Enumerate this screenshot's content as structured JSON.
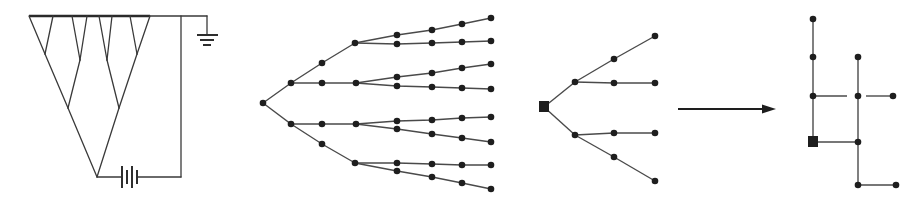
{
  "figure": {
    "panels": [
      {
        "id": "circuit",
        "description": "Branching conductor tree connected to a battery and ground",
        "top_bar": {
          "x1": 29,
          "x2": 150,
          "y": 16
        },
        "branches": [
          [
            29,
            16,
            45,
            54
          ],
          [
            53,
            16,
            45,
            54
          ],
          [
            45,
            54,
            68,
            108
          ],
          [
            72,
            16,
            80,
            60
          ],
          [
            87,
            16,
            80,
            60
          ],
          [
            80,
            60,
            68,
            108
          ],
          [
            68,
            108,
            97,
            177
          ],
          [
            99,
            16,
            107,
            60
          ],
          [
            112,
            16,
            107,
            60
          ],
          [
            107,
            60,
            119,
            108
          ],
          [
            130,
            16,
            137,
            54
          ],
          [
            150,
            16,
            137,
            54
          ],
          [
            137,
            54,
            119,
            108
          ],
          [
            119,
            108,
            97,
            177
          ]
        ],
        "wires": [
          [
            150,
            16,
            207,
            16
          ],
          [
            207,
            16,
            207,
            35
          ],
          [
            181,
            16,
            181,
            177
          ],
          [
            97,
            177,
            121,
            177
          ],
          [
            138,
            177,
            181,
            177
          ]
        ],
        "battery_plates": [
          {
            "x": 122,
            "y1": 166,
            "y2": 188
          },
          {
            "x": 127,
            "y1": 170,
            "y2": 184
          },
          {
            "x": 132,
            "y1": 166,
            "y2": 188
          },
          {
            "x": 137,
            "y1": 170,
            "y2": 184
          }
        ],
        "ground_lines": [
          {
            "x1": 197,
            "x2": 218,
            "y": 35
          },
          {
            "x1": 200,
            "x2": 214,
            "y": 40
          },
          {
            "x1": 203,
            "x2": 211,
            "y": 45
          }
        ]
      },
      {
        "id": "binary-tree",
        "description": "Dotted binary tree graph",
        "nodes": [
          [
            263,
            103
          ],
          [
            291,
            83
          ],
          [
            291,
            124
          ],
          [
            322,
            63
          ],
          [
            322,
            83
          ],
          [
            322,
            124
          ],
          [
            322,
            144
          ],
          [
            355,
            43
          ],
          [
            356,
            83
          ],
          [
            356,
            124
          ],
          [
            355,
            163
          ],
          [
            397,
            35
          ],
          [
            432,
            30
          ],
          [
            462,
            24
          ],
          [
            491,
            18
          ],
          [
            397,
            44
          ],
          [
            432,
            43
          ],
          [
            462,
            42
          ],
          [
            491,
            41
          ],
          [
            397,
            77
          ],
          [
            432,
            73
          ],
          [
            462,
            68
          ],
          [
            491,
            64
          ],
          [
            397,
            86
          ],
          [
            432,
            87
          ],
          [
            462,
            88
          ],
          [
            491,
            89
          ],
          [
            397,
            121
          ],
          [
            432,
            120
          ],
          [
            462,
            118
          ],
          [
            491,
            117
          ],
          [
            397,
            129
          ],
          [
            432,
            134
          ],
          [
            462,
            138
          ],
          [
            491,
            142
          ],
          [
            397,
            163
          ],
          [
            432,
            164
          ],
          [
            462,
            165
          ],
          [
            491,
            165
          ],
          [
            397,
            171
          ],
          [
            432,
            177
          ],
          [
            462,
            183
          ],
          [
            491,
            189
          ]
        ],
        "polylines": [
          [
            [
              263,
              103
            ],
            [
              291,
              83
            ],
            [
              322,
              63
            ],
            [
              355,
              43
            ]
          ],
          [
            [
              291,
              83
            ],
            [
              322,
              83
            ],
            [
              356,
              83
            ]
          ],
          [
            [
              263,
              103
            ],
            [
              291,
              124
            ],
            [
              322,
              124
            ],
            [
              356,
              124
            ]
          ],
          [
            [
              291,
              124
            ],
            [
              322,
              144
            ],
            [
              355,
              163
            ]
          ],
          [
            [
              355,
              43
            ],
            [
              397,
              35
            ],
            [
              432,
              30
            ],
            [
              462,
              24
            ],
            [
              491,
              18
            ]
          ],
          [
            [
              355,
              43
            ],
            [
              397,
              44
            ],
            [
              432,
              43
            ],
            [
              462,
              42
            ],
            [
              491,
              41
            ]
          ],
          [
            [
              356,
              83
            ],
            [
              397,
              77
            ],
            [
              432,
              73
            ],
            [
              462,
              68
            ],
            [
              491,
              64
            ]
          ],
          [
            [
              356,
              83
            ],
            [
              397,
              86
            ],
            [
              432,
              87
            ],
            [
              462,
              88
            ],
            [
              491,
              89
            ]
          ],
          [
            [
              356,
              124
            ],
            [
              397,
              121
            ],
            [
              432,
              120
            ],
            [
              462,
              118
            ],
            [
              491,
              117
            ]
          ],
          [
            [
              356,
              124
            ],
            [
              397,
              129
            ],
            [
              432,
              134
            ],
            [
              462,
              138
            ],
            [
              491,
              142
            ]
          ],
          [
            [
              355,
              163
            ],
            [
              397,
              163
            ],
            [
              432,
              164
            ],
            [
              462,
              165
            ],
            [
              491,
              165
            ]
          ],
          [
            [
              355,
              163
            ],
            [
              397,
              171
            ],
            [
              432,
              177
            ],
            [
              462,
              183
            ],
            [
              491,
              189
            ]
          ]
        ]
      },
      {
        "id": "rooted-tree",
        "description": "Small tree rooted at a square node",
        "root": [
          544,
          107
        ],
        "nodes": [
          [
            575,
            82
          ],
          [
            575,
            135
          ],
          [
            614,
            59
          ],
          [
            614,
            83
          ],
          [
            614,
            133
          ],
          [
            614,
            157
          ],
          [
            655,
            36
          ],
          [
            655,
            83
          ],
          [
            655,
            133
          ],
          [
            655,
            181
          ]
        ],
        "edges": [
          [
            544,
            107,
            575,
            82
          ],
          [
            544,
            107,
            575,
            135
          ],
          [
            575,
            82,
            614,
            59
          ],
          [
            614,
            59,
            655,
            36
          ],
          [
            575,
            82,
            614,
            83
          ],
          [
            614,
            83,
            655,
            83
          ],
          [
            575,
            135,
            614,
            133
          ],
          [
            614,
            133,
            655,
            133
          ],
          [
            575,
            135,
            614,
            157
          ],
          [
            614,
            157,
            655,
            181
          ]
        ]
      },
      {
        "id": "arrow",
        "description": "Transformation arrow",
        "x1": 678,
        "x2": 776,
        "y": 109
      },
      {
        "id": "grid-tree",
        "description": "Rectilinear embedding of the rooted tree",
        "root": [
          813,
          142
        ],
        "nodes": [
          [
            813,
            19
          ],
          [
            813,
            57
          ],
          [
            813,
            96
          ],
          [
            858,
            57
          ],
          [
            858,
            96
          ],
          [
            858,
            142
          ],
          [
            858,
            185
          ],
          [
            893,
            96
          ],
          [
            896,
            185
          ]
        ],
        "edges": [
          [
            813,
            19,
            813,
            137
          ],
          [
            818,
            142,
            858,
            142
          ],
          [
            858,
            57,
            858,
            185
          ],
          [
            813,
            96,
            847,
            96
          ],
          [
            866,
            96,
            893,
            96
          ],
          [
            858,
            185,
            896,
            185
          ]
        ]
      }
    ],
    "colors": {
      "ink": "#1e1e1e",
      "line": "#4a4a4a",
      "background": "#ffffff"
    }
  }
}
